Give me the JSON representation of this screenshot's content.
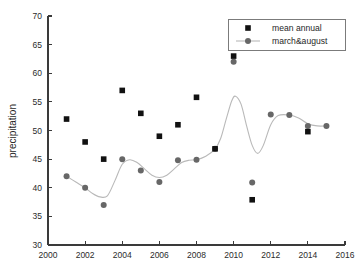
{
  "chart_data": {
    "type": "scatter",
    "title": "",
    "xlabel": "",
    "ylabel": "precipitation",
    "xlim": [
      2000,
      2016
    ],
    "ylim": [
      30,
      70
    ],
    "xticks": [
      2000,
      2002,
      2004,
      2006,
      2008,
      2010,
      2012,
      2014,
      2016
    ],
    "xtick_labels": [
      "2000",
      "2002",
      "2004",
      "2006",
      "2008",
      "2010",
      "2012",
      "2014",
      "2016"
    ],
    "yticks": [
      30,
      35,
      40,
      45,
      50,
      55,
      60,
      65,
      70
    ],
    "ytick_labels": [
      "30",
      "35",
      "40",
      "45",
      "50",
      "55",
      "60",
      "65",
      "70"
    ],
    "grid": false,
    "legend_position": "top-right",
    "series": [
      {
        "name": "mean annual",
        "marker": "square",
        "color": "#111111",
        "line": false,
        "x": [
          2001,
          2002,
          2003,
          2004,
          2005,
          2006,
          2007,
          2008,
          2009,
          2010,
          2011,
          2014
        ],
        "values": [
          52.0,
          48.0,
          45.0,
          57.0,
          53.0,
          49.0,
          51.0,
          55.8,
          46.8,
          63.0,
          37.9,
          49.8
        ]
      },
      {
        "name": "march&august",
        "marker": "circle",
        "color": "#676767",
        "line": true,
        "line_color": "#b9b9b9",
        "x": [
          2001,
          2002,
          2003,
          2004,
          2005,
          2006,
          2007,
          2008,
          2009,
          2010,
          2011,
          2012,
          2013,
          2014,
          2015
        ],
        "values": [
          42.0,
          40.0,
          37.0,
          45.0,
          43.0,
          41.0,
          44.8,
          44.9,
          46.8,
          62.0,
          40.9,
          52.8,
          52.7,
          50.8,
          50.8
        ]
      }
    ],
    "trend_line": {
      "name": "march&august-smoothed",
      "color": "#b9b9b9",
      "note": "smoothed spline through march&august points, peaks near 56 at 2010 and dips to about 46 at 2011.3",
      "points": [
        [
          2001.0,
          42.0
        ],
        [
          2001.5,
          41.0
        ],
        [
          2002.0,
          40.0
        ],
        [
          2002.4,
          39.0
        ],
        [
          2002.8,
          38.4
        ],
        [
          2003.2,
          38.6
        ],
        [
          2003.6,
          41.2
        ],
        [
          2004.0,
          44.1
        ],
        [
          2004.4,
          44.9
        ],
        [
          2004.8,
          44.4
        ],
        [
          2005.2,
          43.3
        ],
        [
          2005.6,
          42.2
        ],
        [
          2006.0,
          41.8
        ],
        [
          2006.4,
          42.2
        ],
        [
          2006.8,
          43.3
        ],
        [
          2007.2,
          44.4
        ],
        [
          2007.6,
          44.8
        ],
        [
          2008.0,
          44.9
        ],
        [
          2008.5,
          45.5
        ],
        [
          2009.0,
          46.8
        ],
        [
          2009.3,
          48.6
        ],
        [
          2009.6,
          52.0
        ],
        [
          2009.9,
          55.2
        ],
        [
          2010.1,
          56.0
        ],
        [
          2010.4,
          54.6
        ],
        [
          2010.7,
          50.8
        ],
        [
          2011.0,
          47.4
        ],
        [
          2011.3,
          46.0
        ],
        [
          2011.6,
          47.4
        ],
        [
          2012.0,
          51.0
        ],
        [
          2012.4,
          52.6
        ],
        [
          2013.0,
          52.7
        ],
        [
          2013.5,
          52.2
        ],
        [
          2014.0,
          51.2
        ],
        [
          2014.5,
          50.8
        ],
        [
          2015.0,
          50.8
        ]
      ]
    }
  },
  "legend": {
    "entries": [
      {
        "label": "mean annual",
        "marker": "square",
        "color": "#111111",
        "with_line": false
      },
      {
        "label": "march&august",
        "marker": "circle",
        "color": "#676767",
        "with_line": true
      }
    ]
  },
  "colors": {
    "background": "#ffffff",
    "axis": "#3a3a3a",
    "text": "#1f1f1f",
    "mean_annual": "#111111",
    "march_august": "#676767",
    "trend_line": "#b9b9b9"
  }
}
